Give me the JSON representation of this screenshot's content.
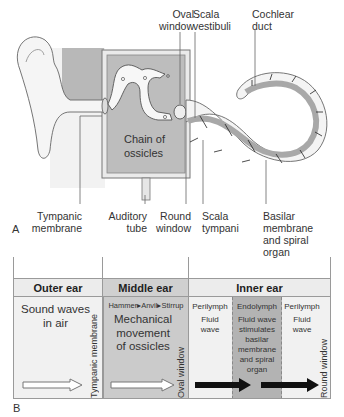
{
  "panel_a": {
    "letter": "A",
    "labels": {
      "oval_window": [
        "Oval",
        "window"
      ],
      "scala_vestibuli": [
        "Scala",
        "vestibuli"
      ],
      "cochlear_duct": [
        "Cochlear",
        "duct"
      ],
      "chain_of_ossicles": [
        "Chain of",
        "ossicles"
      ],
      "tympanic_membrane": [
        "Tympanic",
        "membrane"
      ],
      "auditory_tube": [
        "Auditory",
        "tube"
      ],
      "round_window": [
        "Round",
        "window"
      ],
      "scala_tympani": [
        "Scala",
        "tympani"
      ],
      "basilar_membrane": [
        "Basilar",
        "membrane",
        "and spiral",
        "organ"
      ]
    }
  },
  "panel_b": {
    "letter": "B",
    "headers": {
      "outer": "Outer ear",
      "middle": "Middle ear",
      "inner": "Inner ear"
    },
    "outer": {
      "text": [
        "Sound waves",
        "in air"
      ],
      "boundary": "Tympanic membrane"
    },
    "middle": {
      "sequence": "Hammer▸Anvil▸Stirrup",
      "text": [
        "Mechanical",
        "movement",
        "of ossicles"
      ],
      "boundary": "Oval window"
    },
    "inner": {
      "col1": {
        "title": "Perilymph",
        "text": [
          "Fluid",
          "wave"
        ]
      },
      "col2": {
        "title": "Endolymph",
        "text": [
          "Fluid wave",
          "stimulates",
          "basilar",
          "membrane",
          "and spiral",
          "organ"
        ]
      },
      "col3": {
        "title": "Perilymph",
        "text": [
          "Fluid",
          "wave"
        ]
      },
      "boundary": "Round window"
    }
  },
  "colors": {
    "gray_fill": "#b5b5b5",
    "light_fill": "#efefef",
    "middle_fill": "#c9c9c9",
    "endolymph_fill": "#b0b0b0",
    "header_fill": "#e6e6e6",
    "outline": "#555555"
  }
}
